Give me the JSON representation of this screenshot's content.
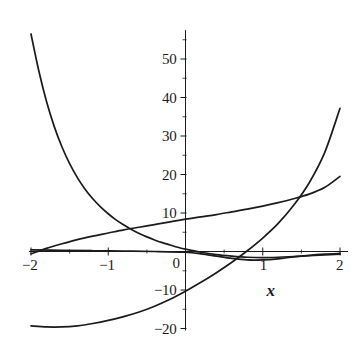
{
  "chart_data": {
    "type": "line",
    "title": "",
    "subtitle": "",
    "xlabel": "x",
    "ylabel": "",
    "xlim": [
      -2,
      2
    ],
    "ylim": [
      -20,
      55
    ],
    "grid": false,
    "legend": "none",
    "x_ticks": [
      {
        "value": -2,
        "label": "−2"
      },
      {
        "value": -1,
        "label": "−1"
      },
      {
        "value": 0,
        "label": "0"
      },
      {
        "value": 1,
        "label": "1"
      },
      {
        "value": 2,
        "label": "2"
      }
    ],
    "y_ticks": [
      {
        "value": -20,
        "label": "−20"
      },
      {
        "value": -10,
        "label": "−10"
      },
      {
        "value": 10,
        "label": "10"
      },
      {
        "value": 20,
        "label": "20"
      },
      {
        "value": 30,
        "label": "30"
      },
      {
        "value": 40,
        "label": "40"
      },
      {
        "value": 50,
        "label": "50"
      }
    ],
    "y_minor_ticks": [
      -15,
      -5,
      5,
      15,
      25,
      35,
      45,
      55
    ],
    "x_minor_ticks": [
      -1.5,
      -0.5,
      0.5,
      1.5
    ],
    "axis_color": "#1b1b1b",
    "curve_color": "#1b1b1b",
    "series": [
      {
        "name": "steep-decay-curve",
        "note": "rapidly decreasing convex curve entering top-left, flattening toward zero on the right",
        "points": [
          [
            -2.0,
            56.5
          ],
          [
            -1.9,
            47.0
          ],
          [
            -1.8,
            39.0
          ],
          [
            -1.7,
            32.5
          ],
          [
            -1.6,
            27.2
          ],
          [
            -1.5,
            22.8
          ],
          [
            -1.4,
            19.2
          ],
          [
            -1.3,
            16.2
          ],
          [
            -1.2,
            13.7
          ],
          [
            -1.1,
            11.6
          ],
          [
            -1.0,
            9.8
          ],
          [
            -0.9,
            8.2
          ],
          [
            -0.8,
            6.9
          ],
          [
            -0.7,
            5.7
          ],
          [
            -0.6,
            4.7
          ],
          [
            -0.5,
            3.8
          ],
          [
            -0.4,
            3.0
          ],
          [
            -0.3,
            2.3
          ],
          [
            -0.2,
            1.7
          ],
          [
            -0.1,
            1.1
          ],
          [
            0.0,
            0.6
          ],
          [
            0.2,
            -0.2
          ],
          [
            0.4,
            -0.8
          ],
          [
            0.6,
            -1.2
          ],
          [
            0.8,
            -1.5
          ],
          [
            1.0,
            -1.6
          ],
          [
            1.2,
            -1.5
          ],
          [
            1.4,
            -1.3
          ],
          [
            1.6,
            -1.1
          ],
          [
            1.8,
            -0.9
          ],
          [
            2.0,
            -0.7
          ]
        ]
      },
      {
        "name": "gentle-rising-curve",
        "note": "slowly rising concave curve from about 0 at x=-2 up to about 19.5 at x=2",
        "points": [
          [
            -2.0,
            -0.6
          ],
          [
            -1.8,
            0.8
          ],
          [
            -1.6,
            2.0
          ],
          [
            -1.4,
            3.1
          ],
          [
            -1.2,
            4.0
          ],
          [
            -1.0,
            4.8
          ],
          [
            -0.8,
            5.6
          ],
          [
            -0.6,
            6.3
          ],
          [
            -0.4,
            7.0
          ],
          [
            -0.2,
            7.7
          ],
          [
            0.0,
            8.4
          ],
          [
            0.2,
            9.0
          ],
          [
            0.4,
            9.6
          ],
          [
            0.6,
            10.3
          ],
          [
            0.8,
            11.0
          ],
          [
            1.0,
            11.8
          ],
          [
            1.2,
            12.7
          ],
          [
            1.4,
            13.7
          ],
          [
            1.6,
            14.9
          ],
          [
            1.8,
            16.6
          ],
          [
            2.0,
            19.5
          ]
        ]
      },
      {
        "name": "steep-rising-curve",
        "note": "curve rising from about -19 at x=-2 through -10 at x=0 to about 37 at x=2",
        "points": [
          [
            -2.0,
            -19.3
          ],
          [
            -1.8,
            -19.6
          ],
          [
            -1.6,
            -19.6
          ],
          [
            -1.4,
            -19.3
          ],
          [
            -1.2,
            -18.7
          ],
          [
            -1.0,
            -17.9
          ],
          [
            -0.8,
            -16.9
          ],
          [
            -0.6,
            -15.7
          ],
          [
            -0.4,
            -14.2
          ],
          [
            -0.2,
            -12.4
          ],
          [
            0.0,
            -10.3
          ],
          [
            0.2,
            -8.0
          ],
          [
            0.4,
            -5.5
          ],
          [
            0.6,
            -2.8
          ],
          [
            0.8,
            0.2
          ],
          [
            1.0,
            3.5
          ],
          [
            1.2,
            7.3
          ],
          [
            1.4,
            12.0
          ],
          [
            1.6,
            17.8
          ],
          [
            1.8,
            25.6
          ],
          [
            2.0,
            37.2
          ]
        ]
      },
      {
        "name": "shallow-dip-curve",
        "note": "nearly flat curve just below the x-axis, minimum near x=0.9, returning toward zero at x=2",
        "points": [
          [
            -2.0,
            0.4
          ],
          [
            -1.6,
            0.3
          ],
          [
            -1.2,
            0.2
          ],
          [
            -0.8,
            0.1
          ],
          [
            -0.4,
            0.0
          ],
          [
            0.0,
            -0.2
          ],
          [
            0.2,
            -0.6
          ],
          [
            0.4,
            -1.2
          ],
          [
            0.6,
            -1.8
          ],
          [
            0.8,
            -2.2
          ],
          [
            1.0,
            -2.2
          ],
          [
            1.2,
            -1.9
          ],
          [
            1.4,
            -1.4
          ],
          [
            1.6,
            -1.0
          ],
          [
            1.8,
            -0.7
          ],
          [
            2.0,
            -0.5
          ]
        ]
      }
    ]
  }
}
